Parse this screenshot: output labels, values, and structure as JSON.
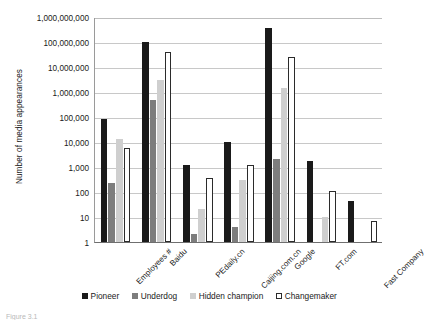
{
  "chart_data": {
    "type": "bar",
    "title": "",
    "xlabel": "",
    "ylabel": "Number of media appearances",
    "yscale": "log",
    "ylim": [
      1,
      1000000000
    ],
    "grid": true,
    "legend_position": "bottom",
    "ytick_labels": [
      "1,000,000,000",
      "100,000,000",
      "10,000,000",
      "1,000,000",
      "100,000",
      "10,000",
      "1,000",
      "100",
      "10",
      "1"
    ],
    "ytick_values": [
      1000000000,
      100000000,
      10000000,
      1000000,
      100000,
      10000,
      1000,
      100,
      10,
      1
    ],
    "categories": [
      "Employees #",
      "Baidu",
      "PEdaily.cn",
      "Caijing.com.cn",
      "Google",
      "FT.com",
      "Fast Company"
    ],
    "series": [
      {
        "name": "Pioneer",
        "color": "#1a1a1a",
        "values": [
          80000,
          100000000,
          1200,
          10000,
          350000000,
          1800,
          45
        ]
      },
      {
        "name": "Underdog",
        "color": "#7d7d7d",
        "values": [
          230,
          500000,
          2,
          4,
          2000,
          null,
          null
        ]
      },
      {
        "name": "Hidden champion",
        "color": "#cfcfcf",
        "values": [
          13000,
          3000000,
          20,
          300,
          1500000,
          10,
          null
        ]
      },
      {
        "name": "Changemaker",
        "color": "#ffffff",
        "values": [
          6000,
          40000000,
          350,
          1200,
          25000000,
          110,
          7
        ]
      }
    ]
  },
  "legend": {
    "items": [
      {
        "label": "Pioneer",
        "key": "pioneer"
      },
      {
        "label": "Underdog",
        "key": "underdog"
      },
      {
        "label": "Hidden champion",
        "key": "hidden"
      },
      {
        "label": "Changemaker",
        "key": "changemaker"
      }
    ]
  },
  "caption": {
    "text": "Figure 3.1"
  }
}
